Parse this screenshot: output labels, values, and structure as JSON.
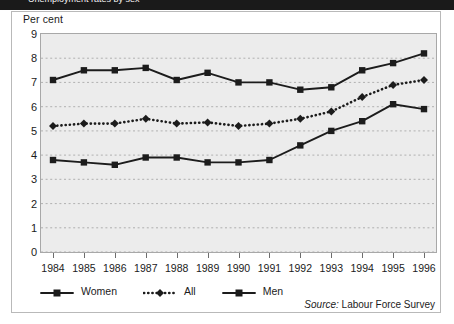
{
  "figure": {
    "banner_text": "Unemployment rates by sex",
    "y_axis_label": "Per cent",
    "source_prefix": "Source:",
    "source_text": "Labour Force Survey"
  },
  "legend": {
    "position": "bottom-left",
    "items": [
      {
        "label": "Women",
        "marker": "square",
        "line": "solid",
        "color": "#1c1c1c"
      },
      {
        "label": "All",
        "marker": "diamond",
        "line": "dotted",
        "color": "#1c1c1c"
      },
      {
        "label": "Men",
        "marker": "square",
        "line": "solid",
        "color": "#1c1c1c"
      }
    ]
  },
  "colors": {
    "plot_background": "#ececec",
    "gridline": "#b0b0b0",
    "series": "#1c1c1c",
    "frame": "#b9b9b9",
    "banner": "#1a1a1a"
  },
  "chart_data": {
    "type": "line",
    "title": "Unemployment rates by sex",
    "xlabel": "",
    "ylabel": "Per cent",
    "ylim": [
      0,
      9
    ],
    "ytick_labels": [
      "0",
      "1",
      "2",
      "3",
      "4",
      "5",
      "6",
      "7",
      "8",
      "9"
    ],
    "yticks": [
      0,
      1,
      2,
      3,
      4,
      5,
      6,
      7,
      8,
      9
    ],
    "grid": true,
    "grid_style": "dotted-horizontal",
    "legend_position": "bottom-left",
    "categories": [
      "1984",
      "1985",
      "1986",
      "1987",
      "1988",
      "1989",
      "1990",
      "1991",
      "1992",
      "1993",
      "1994",
      "1995",
      "1996"
    ],
    "x": [
      1984,
      1985,
      1986,
      1987,
      1988,
      1989,
      1990,
      1991,
      1992,
      1993,
      1994,
      1995,
      1996
    ],
    "series": [
      {
        "name": "Women",
        "marker": "square",
        "line": "solid",
        "values": [
          7.1,
          7.5,
          7.5,
          7.6,
          7.1,
          7.4,
          7.0,
          7.0,
          6.7,
          6.8,
          7.5,
          7.8,
          8.2
        ]
      },
      {
        "name": "All",
        "marker": "diamond",
        "line": "dotted",
        "values": [
          5.2,
          5.3,
          5.3,
          5.5,
          5.3,
          5.35,
          5.2,
          5.3,
          5.5,
          5.8,
          6.4,
          6.9,
          7.1
        ]
      },
      {
        "name": "Men",
        "marker": "square",
        "line": "solid",
        "values": [
          3.8,
          3.7,
          3.6,
          3.9,
          3.9,
          3.7,
          3.7,
          3.8,
          4.4,
          5.0,
          5.4,
          6.1,
          5.9
        ]
      }
    ]
  }
}
